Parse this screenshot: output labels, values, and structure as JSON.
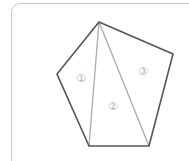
{
  "diagram": {
    "type": "pentagon-triangulation",
    "colors": {
      "outline": "#555555",
      "diagonal": "#aaaaaa",
      "label": "#b0b0b0",
      "card_border": "#c8c8c8"
    },
    "vertices": {
      "top": [
        99,
        22
      ],
      "right": [
        173,
        54
      ],
      "bottom_right": [
        149,
        146
      ],
      "bottom_left": [
        89,
        146
      ],
      "left": [
        57,
        74
      ]
    },
    "diagonals": [
      {
        "from": "top",
        "to": "bottom_left"
      },
      {
        "from": "top",
        "to": "bottom_right"
      }
    ],
    "regions": [
      {
        "label": "①",
        "x": 81,
        "y": 78
      },
      {
        "label": "②",
        "x": 113,
        "y": 106
      },
      {
        "label": "③",
        "x": 143,
        "y": 71
      }
    ]
  }
}
